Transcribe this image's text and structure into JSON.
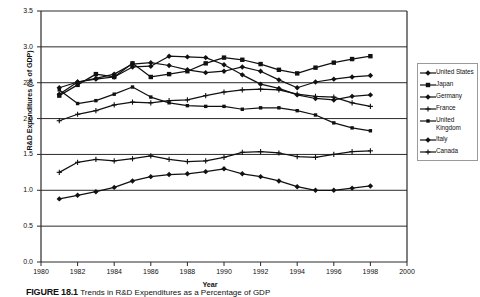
{
  "chart_data": {
    "type": "line",
    "title": "",
    "xlabel": "Year",
    "ylabel": "R&D Expenditures (% of GDP)",
    "xlim": [
      1980,
      2000
    ],
    "ylim": [
      0.0,
      3.5
    ],
    "xticks": [
      1980,
      1982,
      1984,
      1986,
      1988,
      1990,
      1992,
      1994,
      1996,
      1998,
      2000
    ],
    "yticks": [
      "0.0",
      "0.5",
      "1.0",
      "1.5",
      "2.0",
      "2.5",
      "3.0",
      "3.5"
    ],
    "grid": "horizontal",
    "legend_position": "right-outside",
    "x": [
      1981,
      1982,
      1983,
      1984,
      1985,
      1986,
      1987,
      1988,
      1989,
      1990,
      1991,
      1992,
      1993,
      1994,
      1995,
      1996,
      1997,
      1998
    ],
    "series": [
      {
        "name": "United States",
        "marker": "diamond",
        "values": [
          2.34,
          2.51,
          2.56,
          2.62,
          2.76,
          2.78,
          2.74,
          2.68,
          2.64,
          2.66,
          2.72,
          2.66,
          2.54,
          2.43,
          2.51,
          2.55,
          2.58,
          2.6
        ]
      },
      {
        "name": "Japan",
        "marker": "square",
        "values": [
          2.32,
          2.47,
          2.62,
          2.58,
          2.77,
          2.58,
          2.62,
          2.66,
          2.77,
          2.85,
          2.82,
          2.76,
          2.68,
          2.63,
          2.71,
          2.78,
          2.83,
          2.87
        ]
      },
      {
        "name": "Germany",
        "marker": "diamond",
        "values": [
          2.43,
          2.51,
          2.55,
          2.58,
          2.72,
          2.73,
          2.87,
          2.86,
          2.85,
          2.75,
          2.61,
          2.48,
          2.42,
          2.33,
          2.28,
          2.26,
          2.31,
          2.33
        ]
      },
      {
        "name": "France",
        "marker": "plus",
        "values": [
          1.97,
          2.06,
          2.11,
          2.19,
          2.23,
          2.22,
          2.25,
          2.26,
          2.32,
          2.37,
          2.4,
          2.41,
          2.4,
          2.34,
          2.31,
          2.3,
          2.22,
          2.17
        ]
      },
      {
        "name": "United Kingdom",
        "marker": "small-square",
        "values": [
          2.4,
          2.21,
          2.25,
          2.34,
          2.44,
          2.3,
          2.22,
          2.18,
          2.17,
          2.17,
          2.13,
          2.15,
          2.15,
          2.11,
          2.05,
          1.94,
          1.87,
          1.83
        ]
      },
      {
        "name": "Italy",
        "marker": "diamond",
        "values": [
          0.88,
          0.93,
          0.98,
          1.04,
          1.13,
          1.19,
          1.22,
          1.23,
          1.26,
          1.3,
          1.23,
          1.19,
          1.13,
          1.05,
          1.0,
          1.0,
          1.03,
          1.06
        ]
      },
      {
        "name": "Canada",
        "marker": "plus",
        "values": [
          1.25,
          1.39,
          1.43,
          1.41,
          1.44,
          1.48,
          1.43,
          1.4,
          1.41,
          1.46,
          1.53,
          1.54,
          1.52,
          1.47,
          1.46,
          1.5,
          1.54,
          1.55
        ]
      }
    ]
  },
  "legend": {
    "items": [
      {
        "label": "United States",
        "marker": "diamond"
      },
      {
        "label": "Japan",
        "marker": "square"
      },
      {
        "label": "Germany",
        "marker": "diamond"
      },
      {
        "label": "France",
        "marker": "plus"
      },
      {
        "label": "United Kingdom",
        "marker": "small-square"
      },
      {
        "label": "Italy",
        "marker": "diamond"
      },
      {
        "label": "Canada",
        "marker": "plus"
      }
    ]
  },
  "caption": {
    "figure_number": "FIGURE 18.1",
    "text": "Trends in R&D Expenditures as a Percentage of GDP"
  }
}
